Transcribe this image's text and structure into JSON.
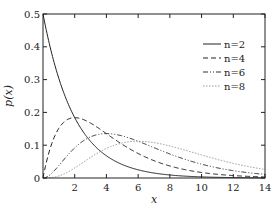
{
  "chart_data": {
    "type": "line",
    "title": "",
    "xlabel": "x",
    "ylabel": "p(x)",
    "xlim": [
      0,
      14
    ],
    "ylim": [
      0,
      0.5
    ],
    "xticks": [
      2,
      4,
      6,
      8,
      10,
      12,
      14
    ],
    "yticks": [
      0,
      0.1,
      0.2,
      0.3,
      0.4,
      0.5
    ],
    "xtick_labels": [
      "2",
      "4",
      "6",
      "8",
      "10",
      "12",
      "14"
    ],
    "ytick_labels": [
      "0",
      "0.1",
      "0.2",
      "0.3",
      "0.4",
      "0.5"
    ],
    "grid": false,
    "legend_position": "upper right",
    "function": "chi-squared pdf p(x) = x^(n/2-1) e^(-x/2) / (2^(n/2) Γ(n/2))",
    "series": [
      {
        "name": "n=2",
        "n": 2,
        "style": "solid",
        "color": "#222222",
        "x": [
          0,
          1,
          2,
          3,
          4,
          6,
          8,
          10,
          12,
          14
        ],
        "values": [
          0.5,
          0.303,
          0.184,
          0.112,
          0.068,
          0.025,
          0.009,
          0.003,
          0.001,
          0.0005
        ]
      },
      {
        "name": "n=4",
        "n": 4,
        "style": "dashed",
        "color": "#222222",
        "x": [
          0,
          1,
          2,
          3,
          4,
          6,
          8,
          10,
          12,
          14
        ],
        "values": [
          0,
          0.152,
          0.184,
          0.167,
          0.135,
          0.075,
          0.037,
          0.017,
          0.007,
          0.003
        ]
      },
      {
        "name": "n=6",
        "n": 6,
        "style": "dash-dot-dot",
        "color": "#333333",
        "x": [
          0,
          1,
          2,
          3,
          4,
          6,
          8,
          10,
          12,
          14
        ],
        "values": [
          0,
          0.038,
          0.092,
          0.126,
          0.135,
          0.112,
          0.073,
          0.042,
          0.022,
          0.011
        ]
      },
      {
        "name": "n=8",
        "n": 8,
        "style": "dotted",
        "color": "#999999",
        "x": [
          0,
          1,
          2,
          3,
          4,
          6,
          8,
          10,
          12,
          14
        ],
        "values": [
          0,
          0.006,
          0.031,
          0.063,
          0.09,
          0.112,
          0.098,
          0.07,
          0.045,
          0.026
        ]
      }
    ]
  }
}
